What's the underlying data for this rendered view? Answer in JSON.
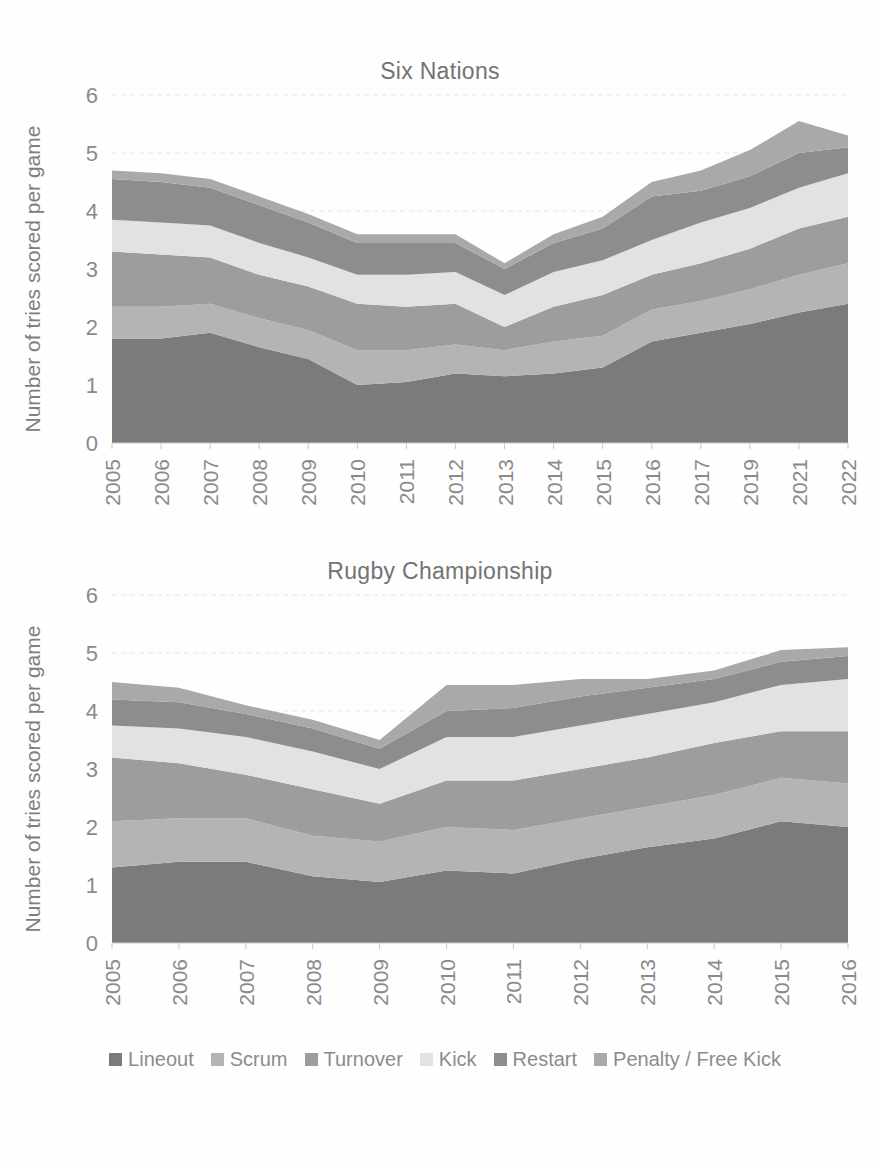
{
  "page": {
    "background": "#fefefe",
    "text_color": "#8a8a8a"
  },
  "charts": [
    {
      "title": "Six Nations",
      "ylabel": "Number of tries scored per game"
    },
    {
      "title": "Rugby Championship",
      "ylabel": "Number of tries scored per game"
    }
  ],
  "legend": {
    "position": "bottom",
    "items": [
      {
        "label": "Lineout",
        "color": "#7b7b7b"
      },
      {
        "label": "Scrum",
        "color": "#b4b4b4"
      },
      {
        "label": "Turnover",
        "color": "#9d9d9d"
      },
      {
        "label": "Kick",
        "color": "#e2e2e2"
      },
      {
        "label": "Restart",
        "color": "#8d8d8d"
      },
      {
        "label": "Penalty / Free Kick",
        "color": "#a9a9a9"
      }
    ]
  },
  "yaxis": {
    "ticks": [
      "0",
      "1",
      "2",
      "3",
      "4",
      "5",
      "6"
    ],
    "min": 0,
    "max": 6
  },
  "chart_data": [
    {
      "type": "area",
      "stacked": true,
      "title": "Six Nations",
      "xlabel": "",
      "ylabel": "Number of tries scored per game",
      "ylim": [
        0,
        6
      ],
      "grid": true,
      "legend_position": "bottom",
      "categories": [
        "2005",
        "2006",
        "2007",
        "2008",
        "2009",
        "2010",
        "2011",
        "2012",
        "2013",
        "2014",
        "2015",
        "2016",
        "2017",
        "2019",
        "2021",
        "2022"
      ],
      "series": [
        {
          "name": "Lineout",
          "color": "#7b7b7b",
          "values": [
            1.8,
            1.8,
            1.9,
            1.65,
            1.45,
            1.0,
            1.05,
            1.2,
            1.15,
            1.2,
            1.3,
            1.75,
            1.9,
            2.05,
            2.25,
            2.4
          ]
        },
        {
          "name": "Scrum",
          "color": "#b4b4b4",
          "values": [
            0.55,
            0.55,
            0.5,
            0.5,
            0.5,
            0.6,
            0.55,
            0.5,
            0.45,
            0.55,
            0.55,
            0.55,
            0.55,
            0.6,
            0.65,
            0.7
          ]
        },
        {
          "name": "Turnover",
          "color": "#9d9d9d",
          "values": [
            0.95,
            0.9,
            0.8,
            0.75,
            0.75,
            0.8,
            0.75,
            0.7,
            0.4,
            0.6,
            0.7,
            0.6,
            0.65,
            0.7,
            0.8,
            0.8
          ]
        },
        {
          "name": "Kick",
          "color": "#e2e2e2",
          "values": [
            0.55,
            0.55,
            0.55,
            0.55,
            0.5,
            0.5,
            0.55,
            0.55,
            0.55,
            0.6,
            0.6,
            0.6,
            0.7,
            0.7,
            0.7,
            0.75
          ]
        },
        {
          "name": "Restart",
          "color": "#8d8d8d",
          "values": [
            0.7,
            0.7,
            0.65,
            0.65,
            0.6,
            0.55,
            0.55,
            0.5,
            0.45,
            0.5,
            0.55,
            0.75,
            0.55,
            0.55,
            0.6,
            0.45
          ]
        },
        {
          "name": "Penalty / Free Kick",
          "color": "#a9a9a9",
          "values": [
            0.15,
            0.15,
            0.15,
            0.15,
            0.15,
            0.15,
            0.15,
            0.15,
            0.1,
            0.15,
            0.2,
            0.25,
            0.35,
            0.45,
            0.55,
            0.2
          ]
        }
      ],
      "totals": [
        4.7,
        4.65,
        4.55,
        4.25,
        3.95,
        3.6,
        3.6,
        3.6,
        3.1,
        3.6,
        3.9,
        4.5,
        4.7,
        5.05,
        5.55,
        5.3
      ]
    },
    {
      "type": "area",
      "stacked": true,
      "title": "Rugby Championship",
      "xlabel": "",
      "ylabel": "Number of tries scored per game",
      "ylim": [
        0,
        6
      ],
      "grid": true,
      "legend_position": "bottom",
      "categories": [
        "2005",
        "2006",
        "2007",
        "2008",
        "2009",
        "2010",
        "2011",
        "2012",
        "2013",
        "2014",
        "2015",
        "2016"
      ],
      "series": [
        {
          "name": "Lineout",
          "color": "#7b7b7b",
          "values": [
            1.3,
            1.4,
            1.4,
            1.15,
            1.05,
            1.25,
            1.2,
            1.45,
            1.65,
            1.8,
            2.1,
            2.0
          ]
        },
        {
          "name": "Scrum",
          "color": "#b4b4b4",
          "values": [
            0.8,
            0.75,
            0.75,
            0.7,
            0.7,
            0.75,
            0.75,
            0.7,
            0.7,
            0.75,
            0.75,
            0.75
          ]
        },
        {
          "name": "Turnover",
          "color": "#9d9d9d",
          "values": [
            1.1,
            0.95,
            0.75,
            0.8,
            0.65,
            0.8,
            0.85,
            0.85,
            0.85,
            0.9,
            0.8,
            0.9
          ]
        },
        {
          "name": "Kick",
          "color": "#e2e2e2",
          "values": [
            0.55,
            0.6,
            0.65,
            0.65,
            0.6,
            0.75,
            0.75,
            0.75,
            0.75,
            0.7,
            0.8,
            0.9
          ]
        },
        {
          "name": "Restart",
          "color": "#8d8d8d",
          "values": [
            0.45,
            0.45,
            0.4,
            0.4,
            0.35,
            0.45,
            0.5,
            0.5,
            0.45,
            0.4,
            0.4,
            0.4
          ]
        },
        {
          "name": "Penalty / Free Kick",
          "color": "#a9a9a9",
          "values": [
            0.3,
            0.25,
            0.15,
            0.15,
            0.15,
            0.45,
            0.4,
            0.3,
            0.15,
            0.15,
            0.2,
            0.15
          ]
        }
      ],
      "totals": [
        4.5,
        4.4,
        4.1,
        3.85,
        3.5,
        4.45,
        4.45,
        4.55,
        4.55,
        4.7,
        5.05,
        5.1
      ]
    }
  ]
}
